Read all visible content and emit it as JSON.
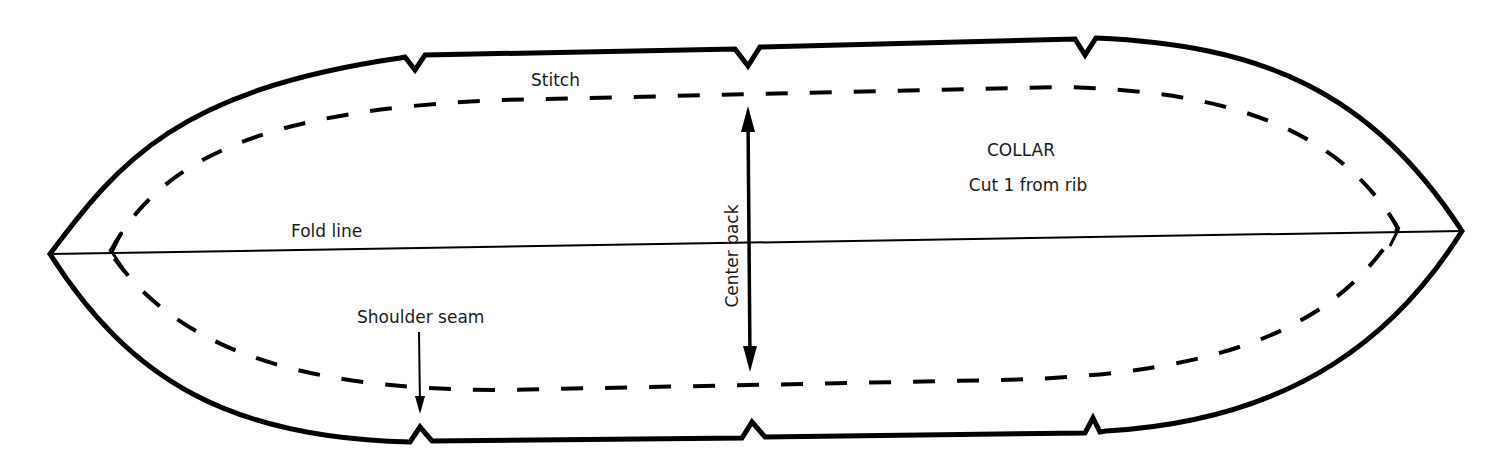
{
  "diagram": {
    "type": "sewing-pattern-piece",
    "piece_name": "COLLAR",
    "cut_instruction": "Cut 1 from rib",
    "labels": {
      "stitch": "Stitch",
      "fold_line": "Fold line",
      "center_back": "Center back",
      "shoulder_seam": "Shoulder seam",
      "title": "COLLAR",
      "cut": "Cut 1 from rib"
    },
    "markers": {
      "notches_top_x": [
        415,
        748,
        1085
      ],
      "notches_bottom_x": [
        420,
        752,
        1093
      ]
    },
    "colors": {
      "line": "#000000",
      "text": "#1a1a1a",
      "background": "#ffffff"
    }
  }
}
